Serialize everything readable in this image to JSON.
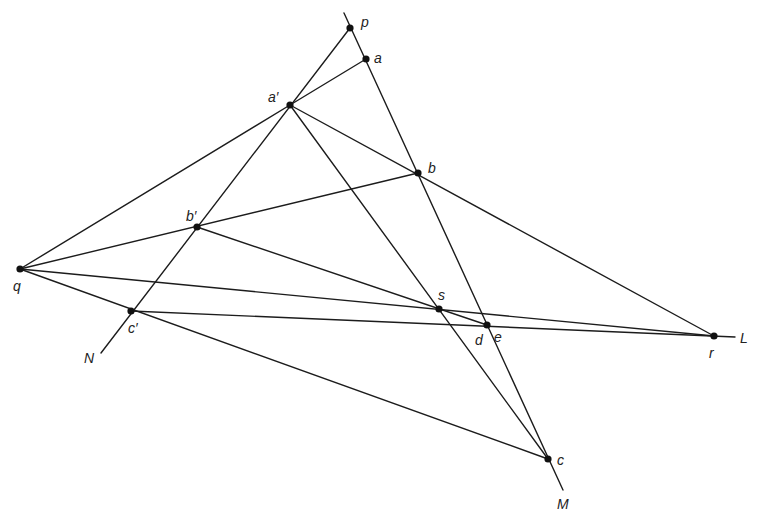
{
  "diagram": {
    "points": {
      "p": {
        "x": 350,
        "y": 28,
        "label": "p",
        "lx": 361,
        "ly": 27
      },
      "a": {
        "x": 366,
        "y": 59,
        "label": "a",
        "lx": 374,
        "ly": 63
      },
      "a_prime": {
        "x": 290,
        "y": 105,
        "label": "a′",
        "lx": 268,
        "ly": 102
      },
      "b": {
        "x": 418,
        "y": 173,
        "label": "b",
        "lx": 428,
        "ly": 173
      },
      "b_prime": {
        "x": 197,
        "y": 227,
        "label": "b′",
        "lx": 186,
        "ly": 221
      },
      "q": {
        "x": 20,
        "y": 269,
        "label": "q",
        "lx": 13,
        "ly": 291
      },
      "c_prime": {
        "x": 131,
        "y": 311,
        "label": "c′",
        "lx": 128,
        "ly": 333
      },
      "s": {
        "x": 439,
        "y": 309,
        "label": "s",
        "lx": 438,
        "ly": 300
      },
      "e": {
        "x": 487,
        "y": 325,
        "label": "e",
        "lx": 494,
        "ly": 342
      },
      "d": {
        "label": "d",
        "lx": 475,
        "ly": 345
      },
      "r": {
        "x": 714,
        "y": 336,
        "label": "r",
        "lx": 709,
        "ly": 358
      },
      "c": {
        "x": 548,
        "y": 459,
        "label": "c",
        "lx": 557,
        "ly": 465
      }
    },
    "line_labels": {
      "L": {
        "label": "L",
        "lx": 740,
        "ly": 343
      },
      "M": {
        "label": "M",
        "lx": 557,
        "ly": 509
      },
      "N": {
        "label": "N",
        "lx": 84,
        "ly": 363
      }
    },
    "lines": [
      {
        "name": "line-M",
        "x1": 344,
        "y1": 13,
        "x2": 563,
        "y2": 490
      },
      {
        "name": "line-N",
        "x1": 350,
        "y1": 28,
        "x2": 101,
        "y2": 353
      },
      {
        "name": "line-L",
        "x1": 131,
        "y1": 311,
        "x2": 735,
        "y2": 337
      },
      {
        "name": "line-a-aprime",
        "x1": 366,
        "y1": 59,
        "x2": 290,
        "y2": 105
      },
      {
        "name": "line-q-aprime",
        "x1": 20,
        "y1": 269,
        "x2": 290,
        "y2": 105
      },
      {
        "name": "line-q-b",
        "x1": 20,
        "y1": 269,
        "x2": 418,
        "y2": 173
      },
      {
        "name": "line-q-r",
        "x1": 20,
        "y1": 269,
        "x2": 714,
        "y2": 336
      },
      {
        "name": "line-q-c",
        "x1": 20,
        "y1": 269,
        "x2": 548,
        "y2": 459
      },
      {
        "name": "line-aprime-r",
        "x1": 290,
        "y1": 105,
        "x2": 714,
        "y2": 336
      },
      {
        "name": "line-aprime-c",
        "x1": 290,
        "y1": 105,
        "x2": 548,
        "y2": 459
      },
      {
        "name": "line-bprime-e",
        "x1": 197,
        "y1": 227,
        "x2": 487,
        "y2": 325
      }
    ]
  }
}
